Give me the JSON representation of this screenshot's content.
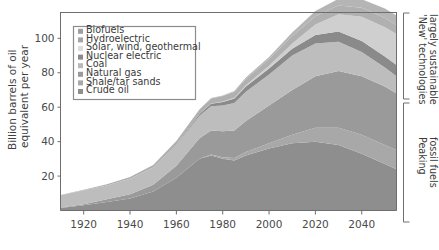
{
  "chart_data": {
    "type": "area",
    "stacked": true,
    "title": "",
    "xlabel": "",
    "ylabel": "Billion barrels of oil equivalent per year",
    "xlim": [
      1910,
      2055
    ],
    "ylim": [
      0,
      115
    ],
    "xticks": [
      1920,
      1940,
      1960,
      1980,
      2000,
      2020,
      2040
    ],
    "yticks": [
      20,
      40,
      60,
      80,
      100
    ],
    "grid": false,
    "legend_position": "upper-left-inside",
    "x": [
      1910,
      1920,
      1930,
      1940,
      1950,
      1960,
      1970,
      1975,
      1980,
      1985,
      1990,
      2000,
      2010,
      2020,
      2030,
      2040,
      2050,
      2055
    ],
    "series": [
      {
        "name": "Crude oil",
        "color": "#8e8e8e",
        "values": [
          1.5,
          3,
          5,
          7,
          11,
          19,
          30,
          32,
          30,
          29,
          32,
          36,
          39,
          40,
          38,
          33,
          27,
          24
        ]
      },
      {
        "name": "Shale/tar sands",
        "color": "#a8a8a8",
        "values": [
          0,
          0,
          0,
          0,
          0,
          0,
          0,
          0.5,
          1,
          1.5,
          2,
          3,
          5,
          8,
          10,
          11,
          11,
          11
        ]
      },
      {
        "name": "Natural gas",
        "color": "#9a9a9a",
        "values": [
          0.3,
          0.7,
          1.5,
          2.5,
          4,
          7,
          12,
          14,
          15,
          16,
          18,
          22,
          26,
          30,
          33,
          34,
          34,
          33
        ]
      },
      {
        "name": "Coal",
        "color": "#bdbdbd",
        "values": [
          7,
          8,
          8,
          9,
          10,
          12,
          13,
          14,
          15,
          16,
          17,
          18,
          20,
          19,
          17,
          14,
          11,
          10
        ]
      },
      {
        "name": "Nuclear electric",
        "color": "#8a8a8a",
        "values": [
          0,
          0,
          0,
          0,
          0,
          0.3,
          1,
          1.5,
          2,
          2.5,
          3,
          3.5,
          4,
          5,
          6,
          6.5,
          6.5,
          6.5
        ]
      },
      {
        "name": "Solar, wind, geothermal",
        "color": "#cfcfcf",
        "values": [
          0,
          0,
          0,
          0,
          0,
          0,
          0.1,
          0.2,
          0.3,
          0.5,
          0.8,
          1.5,
          3,
          6,
          10,
          14,
          17,
          18
        ]
      },
      {
        "name": "Hydroelectric",
        "color": "#b0b0b0",
        "values": [
          0.2,
          0.4,
          0.7,
          1,
          1.4,
          2,
          2.6,
          2.9,
          3.2,
          3.4,
          3.6,
          4,
          4.4,
          4.8,
          5,
          5.2,
          5.3,
          5.3
        ]
      },
      {
        "name": "Biofuels",
        "color": "#b5b5b5",
        "values": [
          0,
          0,
          0,
          0,
          0,
          0,
          0.1,
          0.2,
          0.3,
          0.5,
          0.8,
          1.2,
          2,
          3,
          4,
          5,
          5.5,
          5.5
        ]
      }
    ]
  },
  "legend": {
    "items": [
      {
        "label": "Biofuels",
        "color": "#9e9e9e"
      },
      {
        "label": "Hydroelectric",
        "color": "#a5a5a5"
      },
      {
        "label": "Solar, wind, geothermal",
        "color": "#dcdcdc"
      },
      {
        "label": "Nuclear electric",
        "color": "#8a8a8a"
      },
      {
        "label": "Coal",
        "color": "#b9b9b9"
      },
      {
        "label": "Natural gas",
        "color": "#9a9a9a"
      },
      {
        "label": "Shale/tar sands",
        "color": "#a8a8a8"
      },
      {
        "label": "Crude oil",
        "color": "#8e8e8e"
      }
    ]
  },
  "axes": {
    "ylabel_line1": "Billion barrels of oil",
    "ylabel_line2": "equivalent per year",
    "ytick_labels": [
      "20",
      "40",
      "60",
      "80",
      "100"
    ],
    "xtick_labels": [
      "1920",
      "1940",
      "1960",
      "1980",
      "2000",
      "2020",
      "2040"
    ]
  },
  "annotations": {
    "top_bracket_line1": "'New' technologies",
    "top_bracket_line2": "largely sustainable",
    "bottom_bracket_line1": "Peaking",
    "bottom_bracket_line2": "fossil fuels"
  }
}
